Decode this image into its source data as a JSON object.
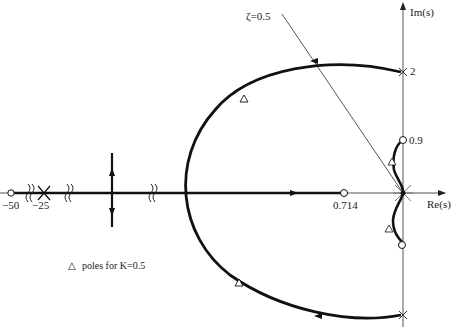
{
  "diagram": {
    "type": "root-locus",
    "axes": {
      "real_label": "Re(s)",
      "imag_label": "Im(s)"
    },
    "damping_line_label": "ζ=0.5",
    "points": {
      "zero_far": "−50",
      "pole_far": "−25",
      "zero_real": "0.714",
      "pole_imag_upper": "2",
      "zero_imag_upper": "0.9"
    },
    "legend": {
      "marker": "△",
      "text": "poles for K=0.5"
    },
    "colors": {
      "locus": "#111111",
      "axis": "#555555",
      "background": "#ffffff"
    }
  }
}
